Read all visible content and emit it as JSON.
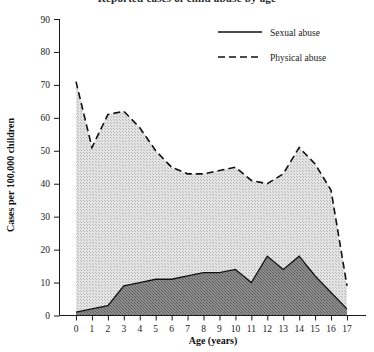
{
  "figure": {
    "title_partial": "Reported cases of child abuse by age",
    "background_color": "#ffffff",
    "ink_color": "#111111"
  },
  "chart_data": {
    "type": "area",
    "title": "",
    "xlabel": "Age (years)",
    "ylabel": "Cases per 100,000 children",
    "x": [
      0,
      1,
      2,
      3,
      4,
      5,
      6,
      7,
      8,
      9,
      10,
      11,
      12,
      13,
      14,
      15,
      16,
      17
    ],
    "xticklabels": [
      "0",
      "1",
      "2",
      "3",
      "4",
      "5",
      "6",
      "7",
      "8",
      "9",
      "10",
      "11",
      "12",
      "13",
      "14",
      "15",
      "16",
      "17"
    ],
    "xlim": [
      0,
      17
    ],
    "ylim": [
      0,
      90
    ],
    "yticks": [
      0,
      10,
      20,
      30,
      40,
      50,
      60,
      70,
      80,
      90
    ],
    "yticklabels": [
      "0",
      "10",
      "20",
      "30",
      "40",
      "50",
      "60",
      "70",
      "80",
      "90"
    ],
    "grid": false,
    "legend_position": "top-right",
    "series": [
      {
        "name": "Sexual abuse",
        "style": "solid",
        "fill_color": "#7a7a7a",
        "line_color": "#111111",
        "values": [
          1,
          2,
          3,
          9,
          10,
          11,
          11,
          12,
          13,
          13,
          14,
          10,
          18,
          14,
          18,
          12,
          7,
          2
        ]
      },
      {
        "name": "Physical abuse",
        "style": "dashed",
        "fill_color": "#cfcfcf",
        "line_color": "#111111",
        "values": [
          71,
          51,
          61,
          62,
          57,
          50,
          45,
          43,
          43,
          44,
          45,
          41,
          40,
          43,
          51,
          46,
          38,
          9
        ]
      }
    ]
  },
  "legend": {
    "items": [
      {
        "label": "Sexual abuse",
        "style": "solid"
      },
      {
        "label": "Physical abuse",
        "style": "dashed"
      }
    ]
  }
}
